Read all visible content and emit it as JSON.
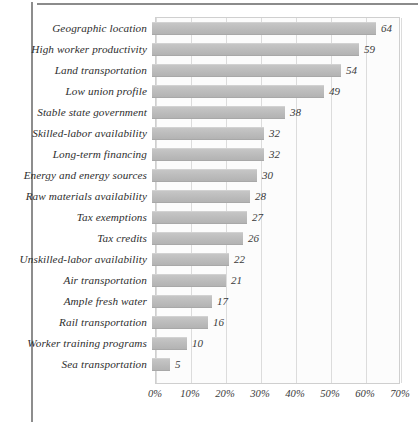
{
  "chart_data": {
    "type": "bar",
    "orientation": "horizontal",
    "title": "",
    "subtitle": "",
    "xlabel": "",
    "ylabel": "",
    "xlim": [
      0,
      70
    ],
    "xticks": [
      0,
      10,
      20,
      30,
      40,
      50,
      60,
      70
    ],
    "xtick_labels": [
      "0%",
      "10%",
      "20%",
      "30%",
      "40%",
      "50%",
      "60%",
      "70%"
    ],
    "grid": "vertical",
    "legend": "none",
    "value_label_suffix": "",
    "categories": [
      "Geographic location",
      "High worker productivity",
      "Land transportation",
      "Low union profile",
      "Stable state government",
      "Skilled-labor availability",
      "Long-term financing",
      "Energy and energy sources",
      "Raw materials availability",
      "Tax exemptions",
      "Tax credits",
      "Unskilled-labor availability",
      "Air transportation",
      "Ample fresh water",
      "Rail transportation",
      "Worker training programs",
      "Sea transportation"
    ],
    "values": [
      64,
      59,
      54,
      49,
      38,
      32,
      32,
      30,
      28,
      27,
      26,
      22,
      21,
      17,
      16,
      10,
      5
    ],
    "value_labels": [
      "64",
      "59",
      "54",
      "49",
      "38",
      "32",
      "32",
      "30",
      "28",
      "27",
      "26",
      "22",
      "21",
      "17",
      "16",
      "10",
      "5"
    ],
    "colors": {
      "bar": "#bdbdbd",
      "plot_background": "#fcfcfc",
      "gridline": "#dcdcdc",
      "frame": "#cfcfcf",
      "text": "#2e2e2e"
    }
  }
}
